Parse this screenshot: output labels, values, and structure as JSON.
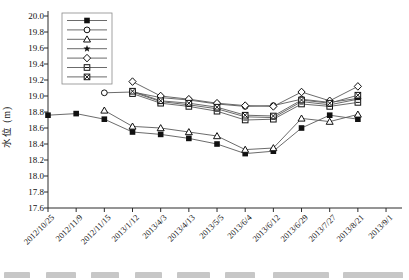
{
  "figure": {
    "background": "#ffffff",
    "axis_color": "#2b2b2b",
    "line_color": "#5a5a5a",
    "marker_color": "#111111",
    "legend_border_color": "#8a8a8a"
  },
  "chart_data": {
    "type": "line",
    "title": "",
    "xlabel": "",
    "ylabel": "水位 (m)",
    "ylim": [
      17.6,
      20.0
    ],
    "ytick_step": 0.2,
    "grid": false,
    "legend_position": "top-left-inside",
    "legend_has_text_labels": false,
    "y_tick_labels": [
      "20.0",
      "19.8",
      "19.6",
      "19.4",
      "19.2",
      "19.0",
      "18.8",
      "18.6",
      "18.4",
      "18.2",
      "18.0",
      "17.8",
      "17.6"
    ],
    "categories": [
      "2012/10/25",
      "2012/11/9",
      "2012/11/15",
      "2013/1/12",
      "2013/4/3",
      "2013/4/13",
      "2013/5/5",
      "2013/6/4",
      "2013/6/12",
      "2013/6/29",
      "2013/7/27",
      "2013/8/21",
      "2013/9/1"
    ],
    "series": [
      {
        "name": "well-1",
        "marker": "square-filled",
        "values": [
          18.76,
          18.78,
          18.71,
          18.55,
          18.52,
          18.47,
          18.4,
          18.28,
          18.31,
          18.6,
          18.76,
          18.71,
          null
        ]
      },
      {
        "name": "well-2",
        "marker": "circle-open",
        "values": [
          null,
          null,
          19.04,
          19.05,
          18.98,
          18.95,
          18.9,
          18.87,
          18.88,
          18.96,
          18.92,
          18.97,
          null
        ]
      },
      {
        "name": "well-3",
        "marker": "triangle-open",
        "values": [
          null,
          null,
          18.82,
          18.62,
          18.6,
          18.55,
          18.5,
          18.33,
          18.35,
          18.72,
          18.68,
          18.77,
          null
        ]
      },
      {
        "name": "well-4",
        "marker": "star-filled",
        "values": [
          null,
          null,
          null,
          19.05,
          18.93,
          18.89,
          18.84,
          18.74,
          18.73,
          18.93,
          18.89,
          18.96,
          null
        ]
      },
      {
        "name": "well-5",
        "marker": "diamond-open",
        "values": [
          null,
          null,
          null,
          19.18,
          19.0,
          18.96,
          18.91,
          18.88,
          18.87,
          19.05,
          18.94,
          19.12,
          null
        ]
      },
      {
        "name": "well-6",
        "marker": "square-minus",
        "values": [
          null,
          null,
          null,
          19.03,
          18.91,
          18.87,
          18.81,
          18.7,
          18.71,
          18.9,
          18.87,
          18.92,
          null
        ]
      },
      {
        "name": "well-7",
        "marker": "square-cross",
        "values": [
          null,
          null,
          null,
          19.06,
          18.94,
          18.91,
          18.86,
          18.76,
          18.75,
          18.95,
          18.91,
          19.01,
          null
        ]
      }
    ]
  }
}
